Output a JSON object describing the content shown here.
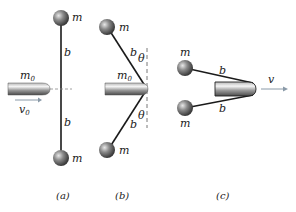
{
  "figure": {
    "panels": [
      {
        "id": "a",
        "caption": "(a)",
        "labels": {
          "mass_top": "m",
          "mass_bottom": "m",
          "rod_top": "b",
          "rod_bottom": "b",
          "bullet_mass": "m",
          "bullet_mass_sub": "0",
          "velocity": "v",
          "velocity_sub": "0"
        }
      },
      {
        "id": "b",
        "caption": "(b)",
        "labels": {
          "mass_top": "m",
          "mass_bottom": "m",
          "rod_top": "b",
          "rod_bottom": "b",
          "angle_top": "θ",
          "angle_bottom": "θ",
          "bullet_mass": "m",
          "bullet_mass_sub": "0"
        }
      },
      {
        "id": "c",
        "caption": "(c)",
        "labels": {
          "mass_top": "m",
          "mass_bottom": "m",
          "rod_top": "b",
          "rod_bottom": "b",
          "velocity": "v"
        }
      }
    ],
    "colors": {
      "line": "#1a1a1a",
      "dashed": "#555555",
      "arrow": "#8a9aa8"
    }
  }
}
